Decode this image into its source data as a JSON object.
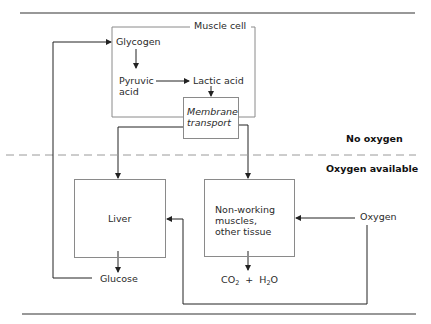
{
  "diagram": {
    "regions": {
      "no_oxygen": "No oxygen",
      "oxygen_available": "Oxygen available"
    },
    "muscle_cell": {
      "label": "Muscle cell",
      "glycogen": "Glycogen",
      "pyruvic_acid_line1": "Pyruvic",
      "pyruvic_acid_line2": "acid",
      "lactic_acid": "Lactic acid",
      "membrane_transport_line1": "Membrane",
      "membrane_transport_line2": "transport"
    },
    "liver": {
      "label": "Liver",
      "output": "Glucose"
    },
    "tissue": {
      "line1": "Non-working",
      "line2": "muscles,",
      "line3": "other tissue",
      "output_co2": "CO",
      "output_co2_sub": "2",
      "output_plus": "+",
      "output_h": "H",
      "output_h2o_sub": "2",
      "output_o": "O"
    },
    "oxygen": "Oxygen",
    "colors": {
      "line": "#222222",
      "box_border": "#8a8a8a",
      "dashed": "#9a9a9a"
    }
  }
}
